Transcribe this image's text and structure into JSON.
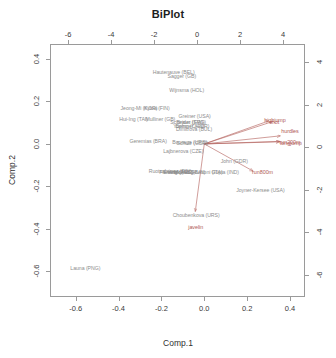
{
  "chart_data": {
    "type": "scatter",
    "title": "BiPlot",
    "xlabel": "Comp.1",
    "ylabel": "Comp.2",
    "xlim": [
      -0.72,
      0.47
    ],
    "ylim": [
      -0.72,
      0.47
    ],
    "grid": false,
    "legend": "none",
    "axes": {
      "bottom": {
        "name": "comp1-axis",
        "ticks": [
          "-0.6",
          "-0.4",
          "-0.2",
          "0.0",
          "0.2",
          "0.4"
        ],
        "values": [
          -0.6,
          -0.4,
          -0.2,
          0.0,
          0.2,
          0.4
        ]
      },
      "left": {
        "name": "comp2-axis",
        "ticks": [
          "0.4",
          "0.2",
          "0.0",
          "-0.2",
          "-0.4",
          "-0.6"
        ],
        "values": [
          0.4,
          0.2,
          0.0,
          -0.2,
          -0.4,
          -0.6
        ]
      },
      "top": {
        "name": "loading-x-axis",
        "ticks": [
          "-6",
          "-4",
          "-2",
          "0",
          "2",
          "4"
        ],
        "values": [
          -6,
          -4,
          -2,
          0,
          2,
          4
        ]
      },
      "right": {
        "name": "loading-y-axis",
        "ticks": [
          "4",
          "2",
          "0",
          "-2",
          "-4",
          "-6"
        ],
        "values": [
          4,
          2,
          0,
          -2,
          -4,
          -6
        ]
      }
    },
    "point_color": "#8d8d8d",
    "arrow_color": "#b05a55",
    "points": [
      {
        "label": "Hautenauve (BEL)",
        "x": -0.143,
        "y": 0.337
      },
      {
        "label": "Sagger (GB)",
        "x": -0.105,
        "y": 0.318
      },
      {
        "label": "Wijnsma (HOL)",
        "x": -0.082,
        "y": 0.255
      },
      {
        "label": "Jeong-Mi (KOR)",
        "x": -0.305,
        "y": 0.168
      },
      {
        "label": "Kytoa (FIN)",
        "x": -0.222,
        "y": 0.168
      },
      {
        "label": "Greiner (USA)",
        "x": -0.045,
        "y": 0.133
      },
      {
        "label": "Hui-Ing (TAI)",
        "x": -0.33,
        "y": 0.118
      },
      {
        "label": "Mulliner (GB)",
        "x": -0.205,
        "y": 0.118
      },
      {
        "label": "Scheider (SWI)",
        "x": -0.078,
        "y": 0.104
      },
      {
        "label": "Braun (FRG)",
        "x": -0.06,
        "y": 0.104
      },
      {
        "label": "Yuping (CHN)",
        "x": -0.072,
        "y": 0.083
      },
      {
        "label": "Behmer (GDR)",
        "x": -0.055,
        "y": 0.083
      },
      {
        "label": "Dimitrova (BUL)",
        "x": -0.048,
        "y": 0.072
      },
      {
        "label": "Geremias (BRA)",
        "x": -0.262,
        "y": 0.012
      },
      {
        "label": "Bouraga (URS)",
        "x": -0.068,
        "y": 0.008
      },
      {
        "label": "Schulz (GDR)",
        "x": -0.056,
        "y": 0.006
      },
      {
        "label": "Lajbnerova (CZE)",
        "x": -0.098,
        "y": -0.032
      },
      {
        "label": "John (GDR)",
        "x": 0.14,
        "y": -0.082
      },
      {
        "label": "Ruotsalainen (FIN)",
        "x": -0.16,
        "y": -0.128
      },
      {
        "label": "Fleming (AUS)",
        "x": -0.132,
        "y": -0.13
      },
      {
        "label": "Everts (FRG)",
        "x": -0.12,
        "y": -0.132
      },
      {
        "label": "Wark (AUS)",
        "x": -0.105,
        "y": -0.133
      },
      {
        "label": "Molnar (HUN)",
        "x": -0.068,
        "y": -0.131
      },
      {
        "label": "Bettoni (ITA)",
        "x": 0.02,
        "y": -0.131
      },
      {
        "label": "Gupta (IND)",
        "x": 0.098,
        "y": -0.131
      },
      {
        "label": "Joyner-Kersee (USA)",
        "x": 0.262,
        "y": -0.218
      },
      {
        "label": "Choubenkova (URS)",
        "x": -0.038,
        "y": -0.332
      },
      {
        "label": "Launa (PNG)",
        "x": -0.555,
        "y": -0.583
      }
    ],
    "arrows": [
      {
        "label": "hurdles",
        "dx": 0.355,
        "dy": 0.038,
        "label_x": 0.4,
        "label_y": 0.062
      },
      {
        "label": "highjump",
        "dx": 0.3,
        "dy": 0.108,
        "label_x": 0.33,
        "label_y": 0.112
      },
      {
        "label": "shot",
        "dx": 0.318,
        "dy": 0.105,
        "label_x": 0.326,
        "label_y": 0.105
      },
      {
        "label": "run200m",
        "dx": 0.352,
        "dy": 0.01,
        "label_x": 0.4,
        "label_y": 0.008
      },
      {
        "label": "longjump",
        "dx": 0.352,
        "dy": 0.012,
        "label_x": 0.404,
        "label_y": 0.006
      },
      {
        "label": "run800m",
        "dx": 0.228,
        "dy": -0.128,
        "label_x": 0.272,
        "label_y": -0.132
      },
      {
        "label": "javelin",
        "dx": -0.042,
        "dy": -0.318,
        "label_x": -0.04,
        "label_y": -0.392
      }
    ]
  }
}
